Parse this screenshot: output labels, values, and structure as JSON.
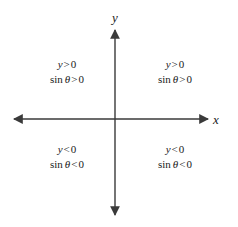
{
  "figure": {
    "width": 238,
    "height": 227,
    "background_color": "#ffffff",
    "axis_color": "#3a3a3a",
    "text_color": "#1a1a1a"
  },
  "axes": {
    "x_label": "x",
    "y_label": "y",
    "origin": {
      "x": 115,
      "y": 119
    },
    "x_axis": {
      "start": 14,
      "end": 208,
      "arrows": "both"
    },
    "y_axis": {
      "start": 30,
      "end": 215,
      "arrows": "both"
    }
  },
  "quadrants": [
    {
      "id": "quadrant-1",
      "position": "upper-right",
      "line1": {
        "variable": "y",
        "operator": ">",
        "value": "0"
      },
      "line2": {
        "function": "sin",
        "argument": "θ",
        "operator": ">",
        "value": "0"
      }
    },
    {
      "id": "quadrant-2",
      "position": "upper-left",
      "line1": {
        "variable": "y",
        "operator": ">",
        "value": "0"
      },
      "line2": {
        "function": "sin",
        "argument": "θ",
        "operator": ">",
        "value": "0"
      }
    },
    {
      "id": "quadrant-3",
      "position": "lower-left",
      "line1": {
        "variable": "y",
        "operator": "<",
        "value": "0"
      },
      "line2": {
        "function": "sin",
        "argument": "θ",
        "operator": "<",
        "value": "0"
      }
    },
    {
      "id": "quadrant-4",
      "position": "lower-right",
      "line1": {
        "variable": "y",
        "operator": "<",
        "value": "0"
      },
      "line2": {
        "function": "sin",
        "argument": "θ",
        "operator": "<",
        "value": "0"
      }
    }
  ]
}
